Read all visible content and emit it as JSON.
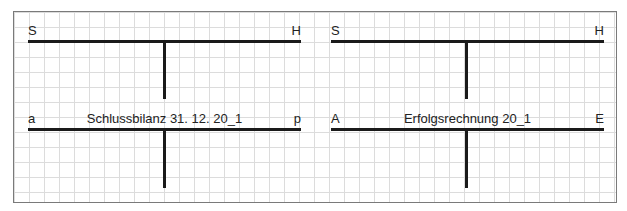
{
  "accounts": [
    {
      "left_label": "S",
      "right_label": "H",
      "title": ""
    },
    {
      "left_label": "S",
      "right_label": "H",
      "title": ""
    },
    {
      "left_label": "a",
      "right_label": "p",
      "title": "Schlussbilanz 31. 12. 20_1"
    },
    {
      "left_label": "A",
      "right_label": "E",
      "title": "Erfolgsrechnung 20_1"
    }
  ],
  "colors": {
    "line": "#1a1a1a",
    "grid": "#dcdcdc",
    "border": "#7a7a7a"
  }
}
